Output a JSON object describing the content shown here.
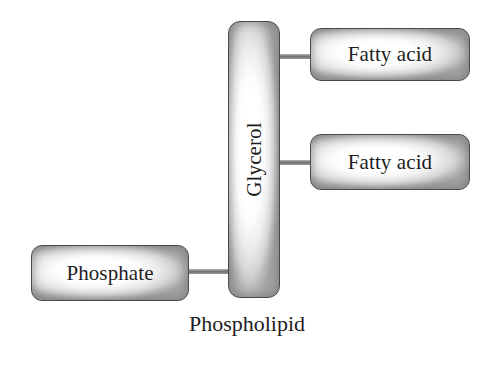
{
  "diagram": {
    "title": "Phospholipid",
    "caption": "Phospholipid",
    "type": "molecular-structure-block-diagram",
    "background_color": "#ffffff",
    "box_border_color": "#4a4a4a",
    "box_fill_color": "#ffffff",
    "box_shade_color": "#a2a2a2",
    "connector_color": "#6f6f6f",
    "text_color": "#1d1d1d",
    "nodes": [
      {
        "id": "glycerol",
        "label": "Glycerol",
        "orientation": "vertical",
        "rotation_degrees": -90
      },
      {
        "id": "fatty-acid-1",
        "label": "Fatty acid",
        "orientation": "horizontal",
        "rotation_degrees": 0
      },
      {
        "id": "fatty-acid-2",
        "label": "Fatty acid",
        "orientation": "horizontal",
        "rotation_degrees": 0
      },
      {
        "id": "phosphate",
        "label": "Phosphate",
        "orientation": "horizontal",
        "rotation_degrees": 0
      }
    ],
    "connectors": [
      {
        "id": "glycerol-fatty-1",
        "from": "glycerol",
        "to": "fatty-acid-1"
      },
      {
        "id": "glycerol-fatty-2",
        "from": "glycerol",
        "to": "fatty-acid-2"
      },
      {
        "id": "phosphate-glycerol",
        "from": "phosphate",
        "to": "glycerol"
      }
    ]
  }
}
